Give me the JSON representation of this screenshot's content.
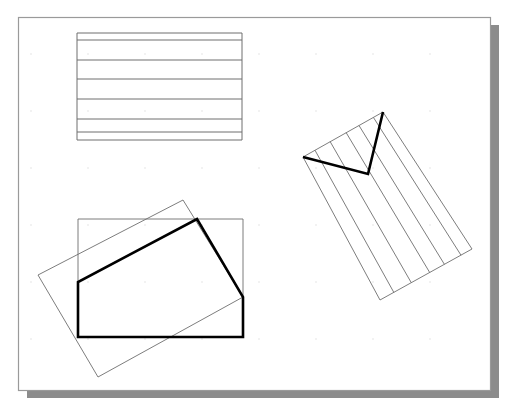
{
  "document": {
    "title": "Geometric Construction Figure",
    "background_color": "#ffffff",
    "width": 516,
    "height": 411
  },
  "page_frame": {
    "name": "page-sheet",
    "x": 18,
    "y": 17,
    "width": 472,
    "height": 373,
    "fill": "#ffffff",
    "stroke": "#9a9a9a",
    "stroke_width": 1.2,
    "shadow": {
      "offset_x": 9,
      "offset_y": 8,
      "color": "#8c8c8c"
    }
  },
  "grid": {
    "visible": true,
    "dot_color": "#dcdcdc",
    "dot_radius": 0.7,
    "spacing_x": 57,
    "spacing_y": 57,
    "origin_x": 31,
    "origin_y": 54
  },
  "styles": {
    "thin_stroke": "#6e6e6e",
    "thin_width": 0.9,
    "thick_stroke": "#000000",
    "thick_width": 2.6
  },
  "shapes": [
    {
      "id": "banded-rectangle",
      "name": "banded-rectangle",
      "label": "Horizontally banded rectangle",
      "type": "rect-with-bands",
      "stroke": "#6e6e6e",
      "stroke_width": 1.0,
      "outline": [
        [
          77,
          33
        ],
        [
          242,
          33
        ],
        [
          242,
          140
        ],
        [
          77,
          140
        ]
      ],
      "band_lines_y": [
        40,
        60,
        79,
        99,
        119,
        132
      ]
    },
    {
      "id": "axis-rectangle",
      "name": "axis-aligned-rectangle",
      "label": "Axis aligned outline rectangle",
      "type": "polygon",
      "stroke": "#6e6e6e",
      "stroke_width": 0.9,
      "points": [
        [
          78,
          219
        ],
        [
          243,
          219
        ],
        [
          243,
          337
        ],
        [
          78,
          337
        ]
      ]
    },
    {
      "id": "tilted-rectangle",
      "name": "tilted-rectangle",
      "label": "Rotated outline rectangle",
      "type": "polygon",
      "stroke": "#6e6e6e",
      "stroke_width": 0.9,
      "points": [
        [
          183,
          200
        ],
        [
          243,
          297
        ],
        [
          98,
          377
        ],
        [
          38,
          275
        ]
      ]
    },
    {
      "id": "pentagon",
      "name": "thick-pentagon",
      "label": "Bold clipped pentagon",
      "type": "polygon",
      "stroke": "#000000",
      "stroke_width": 2.6,
      "points": [
        [
          78,
          337
        ],
        [
          78,
          282
        ],
        [
          197,
          219
        ],
        [
          243,
          297
        ],
        [
          243,
          337
        ]
      ]
    },
    {
      "id": "striped-rectangle",
      "name": "striped-tilted-rectangle",
      "label": "Rotated rectangle with parallel stripes",
      "type": "polygon",
      "stroke": "#6e6e6e",
      "stroke_width": 0.9,
      "points": [
        [
          383,
          112
        ],
        [
          472,
          249
        ],
        [
          380,
          300
        ],
        [
          303,
          157
        ]
      ],
      "stripe_count": 5,
      "stripe_offsets": [
        0.12,
        0.3,
        0.46,
        0.66,
        0.85
      ]
    },
    {
      "id": "zigzag",
      "name": "thick-zigzag-path",
      "label": "Bold V shaped polyline",
      "type": "polyline",
      "stroke": "#000000",
      "stroke_width": 2.6,
      "points": [
        [
          303,
          157
        ],
        [
          368,
          174
        ],
        [
          383,
          112
        ]
      ]
    }
  ]
}
